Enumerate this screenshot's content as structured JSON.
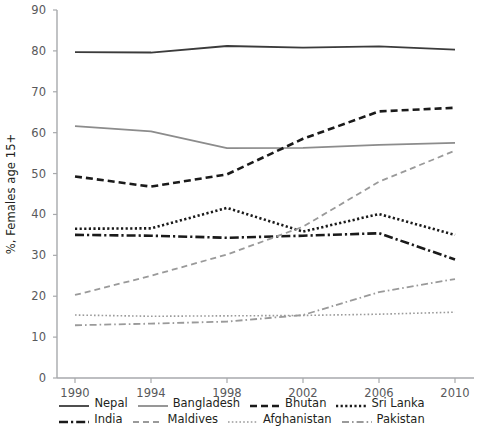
{
  "chart_data": {
    "type": "line",
    "title": "",
    "xlabel": "",
    "ylabel": "%, Females age 15+",
    "x": [
      1990,
      1994,
      1998,
      2002,
      2006,
      2010
    ],
    "categories": [
      "1990",
      "1994",
      "1998",
      "2002",
      "2006",
      "2010"
    ],
    "ylim": [
      0,
      90
    ],
    "yticks": [
      0,
      10,
      20,
      30,
      40,
      50,
      60,
      70,
      80,
      90
    ],
    "ytick_labels": [
      "0",
      "10",
      "20",
      "30",
      "40",
      "50",
      "60",
      "70",
      "80",
      "90"
    ],
    "grid": false,
    "legend_position": "bottom",
    "series": [
      {
        "name": "Nepal",
        "values": [
          79.7,
          79.6,
          81.2,
          80.8,
          81.1,
          80.3
        ],
        "style": "solid",
        "color": "#3b3b3b",
        "width": 1.8
      },
      {
        "name": "Bangladesh",
        "values": [
          61.6,
          60.3,
          56.2,
          56.3,
          57.0,
          57.5
        ],
        "style": "solid",
        "color": "#8c8c8c",
        "width": 1.8
      },
      {
        "name": "Bhutan",
        "values": [
          49.3,
          46.8,
          49.8,
          58.5,
          65.2,
          66.1
        ],
        "style": "dashed",
        "color": "#1a1a1a",
        "width": 2.6
      },
      {
        "name": "Sri Lanka",
        "values": [
          36.5,
          36.6,
          41.6,
          35.8,
          40.1,
          35.0
        ],
        "style": "dotted",
        "color": "#1a1a1a",
        "width": 2.6
      },
      {
        "name": "India",
        "values": [
          35.0,
          34.8,
          34.3,
          34.8,
          35.4,
          29.0
        ],
        "style": "dashdot",
        "color": "#1a1a1a",
        "width": 2.6
      },
      {
        "name": "Maldives",
        "values": [
          20.3,
          25.0,
          30.2,
          37.0,
          48.0,
          55.6
        ],
        "style": "dashed",
        "color": "#9a9a9a",
        "width": 1.8
      },
      {
        "name": "Afghanistan",
        "values": [
          15.4,
          15.1,
          15.2,
          15.3,
          15.6,
          16.1
        ],
        "style": "dotted",
        "color": "#9a9a9a",
        "width": 1.6
      },
      {
        "name": "Pakistan",
        "values": [
          12.9,
          13.3,
          13.8,
          15.4,
          21.0,
          24.2
        ],
        "style": "dashdot",
        "color": "#9a9a9a",
        "width": 1.8
      }
    ]
  },
  "axes": {
    "y_label": "%, Females age 15+",
    "y_ticks": [
      "90",
      "80",
      "70",
      "60",
      "50",
      "40",
      "30",
      "20",
      "10",
      "0"
    ],
    "x_ticks": [
      "1990",
      "1994",
      "1998",
      "2002",
      "2006",
      "2010"
    ]
  },
  "legend": {
    "rows": [
      [
        {
          "label": "Nepal",
          "icon": "solid-line-swatch"
        },
        {
          "label": "Bangladesh",
          "icon": "solid-line-swatch"
        },
        {
          "label": "Bhutan",
          "icon": "dashed-line-swatch"
        },
        {
          "label": "Sri Lanka",
          "icon": "dotted-line-swatch"
        }
      ],
      [
        {
          "label": "India",
          "icon": "dashdot-line-swatch"
        },
        {
          "label": "Maldives",
          "icon": "dashed-line-swatch"
        },
        {
          "label": "Afghanistan",
          "icon": "dotted-line-swatch"
        },
        {
          "label": "Pakistan",
          "icon": "dashdot-line-swatch"
        }
      ]
    ]
  },
  "source_note": ""
}
